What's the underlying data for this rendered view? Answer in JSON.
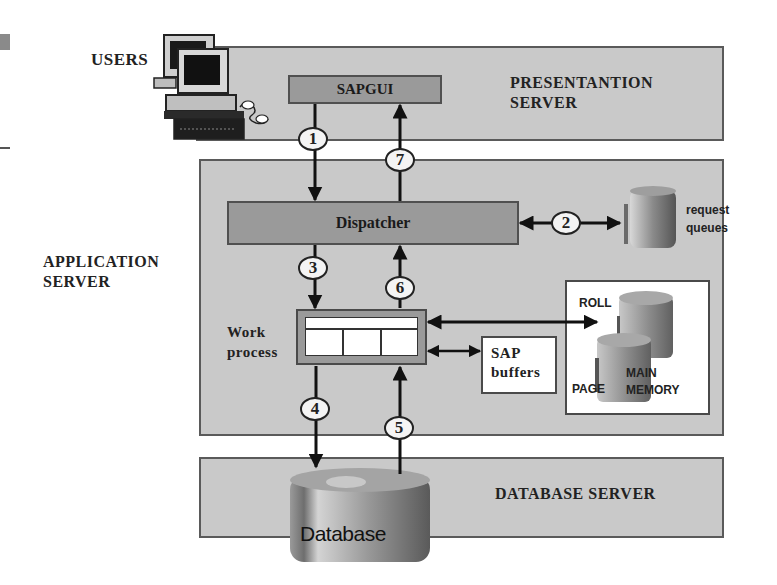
{
  "diagram": {
    "tiers": {
      "presentation": {
        "label_line1": "PRESENTANTION",
        "label_line2": "SERVER"
      },
      "application": {
        "label_line1": "APPLICATION",
        "label_line2": "SERVER"
      },
      "database": {
        "label": "DATABASE SERVER"
      }
    },
    "users_label": "USERS",
    "components": {
      "sapgui": "SAPGUI",
      "dispatcher": "Dispatcher",
      "work_process_line1": "Work",
      "work_process_line2": "process",
      "sap_buffers_line1": "SAP",
      "sap_buffers_line2": "buffers",
      "request_queues_line1": "request",
      "request_queues_line2": "queues",
      "roll": "ROLL",
      "page": "PAGE",
      "main_memory_line1": "MAIN",
      "main_memory_line2": "MEMORY",
      "database": "Database"
    },
    "steps": [
      "1",
      "2",
      "3",
      "4",
      "5",
      "6",
      "7"
    ],
    "colors": {
      "tier_fill": "#c9c9c9",
      "box_fill": "#9a9a9a",
      "border": "#505050",
      "arrow": "#111111"
    }
  }
}
